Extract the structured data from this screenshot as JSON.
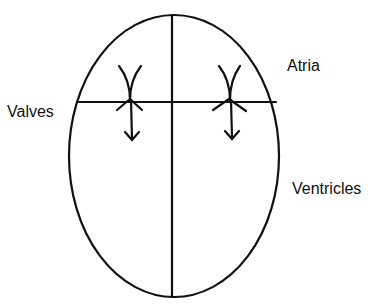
{
  "diagram": {
    "type": "heart-chambers-schematic",
    "labels": {
      "valves": "Valves",
      "atria": "Atria",
      "ventricles": "Ventricles"
    },
    "colors": {
      "stroke": "#111111",
      "background": "#ffffff"
    },
    "shapes": {
      "outline": {
        "shape": "ellipse",
        "cx": 174,
        "cy": 156,
        "rx": 105,
        "ry": 141
      },
      "septum": {
        "shape": "vertical-line",
        "x": 172
      },
      "valve_plane": {
        "shape": "horizontal-line",
        "y": 102
      },
      "valves": [
        {
          "side": "left",
          "x": 130,
          "flow": "down"
        },
        {
          "side": "right",
          "x": 233,
          "flow": "down"
        }
      ]
    }
  }
}
